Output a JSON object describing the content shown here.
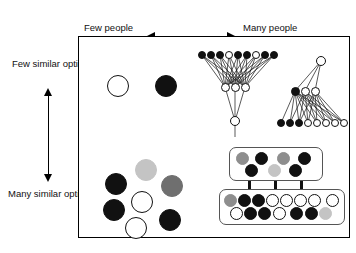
{
  "figure": {
    "type": "conceptual-2x2-diagram",
    "title": "",
    "x_axis": {
      "left_label": "Few people",
      "right_label": "Many people",
      "arrow": "double-headed-horizontal"
    },
    "y_axis": {
      "top_label": "Few similar options",
      "bottom_label": "Many similar options",
      "arrow": "double-headed-vertical"
    },
    "colors": {
      "black": "#111111",
      "white": "#ffffff",
      "gray": "#8e8e8e",
      "light_gray": "#c4c4c4",
      "dark_gray": "#6f6f6f",
      "frame": "#000000",
      "box_border": "#555555"
    },
    "quadrants": [
      {
        "name": "few-people-few-options",
        "position": "top-left",
        "nodes": [
          "white",
          "black"
        ]
      },
      {
        "name": "few-people-many-options",
        "position": "bottom-left",
        "nodes": [
          "black",
          "lgray",
          "dgray",
          "black",
          "white",
          "white",
          "black"
        ]
      },
      {
        "name": "many-people-few-options",
        "position": "top-right",
        "structures": [
          {
            "name": "funnel",
            "top_row": [
              "black",
              "black",
              "black",
              "white",
              "black",
              "black",
              "white",
              "black",
              "black"
            ],
            "middle_row": [
              "white",
              "white",
              "white"
            ],
            "bottom_node": "white"
          },
          {
            "name": "inverted-tree",
            "top_node": "white",
            "middle_row": [
              "black",
              "white",
              "white"
            ],
            "bottom_row": [
              "black",
              "black",
              "black",
              "white",
              "white",
              "white",
              "white",
              "white",
              "white"
            ]
          }
        ]
      },
      {
        "name": "many-people-many-options",
        "position": "bottom-right",
        "structures": [
          {
            "name": "upper-pool-box",
            "row_a": [
              "gray",
              "black",
              "gray",
              "black"
            ],
            "row_b": [
              "black",
              "lgray",
              "black"
            ]
          },
          {
            "name": "arrows",
            "count": 3,
            "direction": "down"
          },
          {
            "name": "lower-pool-box",
            "row_a": [
              "gray",
              "black",
              "black",
              "white",
              "white",
              "white",
              "white",
              "white"
            ],
            "row_b": [
              "white",
              "black",
              "black",
              "white",
              "white",
              "black",
              "black",
              "lgray"
            ]
          }
        ]
      }
    ]
  }
}
